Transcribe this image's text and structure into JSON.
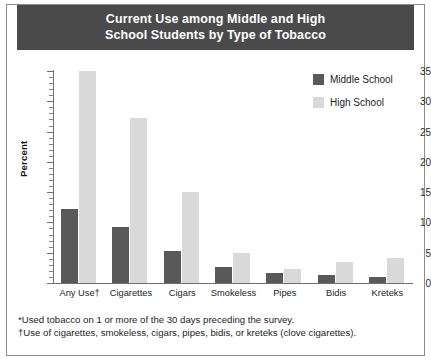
{
  "figure": {
    "title": "Current Use among Middle and High\nSchool Students by Type of Tobacco",
    "footnotes": [
      "*Used tobacco on 1 or more of the 30 days preceding the survey.",
      "†Use of cigarettes, smokeless, cigars, pipes, bidis, or kreteks (clove cigarettes)."
    ]
  },
  "colors": {
    "banner": "#4a4a4a",
    "middle_school": "#595959",
    "high_school": "#d9d9d9",
    "axis": "#6f6f6f",
    "frame": "#8d8d8d",
    "background": "#ffffff"
  },
  "legend": {
    "position": "top-right",
    "entries": [
      {
        "label": "Middle School",
        "color": "#595959",
        "swatch": "middle-school-swatch"
      },
      {
        "label": "High School",
        "color": "#d9d9d9",
        "swatch": "high-school-swatch"
      }
    ]
  },
  "chart_data": {
    "type": "bar",
    "title": "Current Use among Middle and High School Students by Type of Tobacco",
    "xlabel": "",
    "ylabel": "Percent",
    "ylim": [
      0,
      35
    ],
    "ytick_labels": [
      "0",
      "5",
      "10",
      "15",
      "20",
      "25",
      "30",
      "35"
    ],
    "ytick_values": [
      0,
      5,
      10,
      15,
      20,
      25,
      30,
      35
    ],
    "ytick_minor_step": 1,
    "grid": false,
    "legend_position": "upper right",
    "categories": [
      "Any Use†",
      "Cigarettes",
      "Cigars",
      "Smokeless",
      "Pipes",
      "Bidis",
      "Kreteks"
    ],
    "series": [
      {
        "name": "Middle School",
        "color": "#595959",
        "values": [
          12.2,
          9.2,
          5.3,
          2.7,
          1.6,
          1.4,
          1.0
        ]
      },
      {
        "name": "High School",
        "color": "#d9d9d9",
        "values": [
          35.0,
          27.3,
          15.0,
          4.9,
          2.3,
          3.5,
          4.1
        ]
      }
    ],
    "annotations": [
      "*Used tobacco on 1 or more of the 30 days preceding the survey.",
      "†Use of cigarettes, smokeless, cigars, pipes, bidis, or kreteks (clove cigarettes)."
    ]
  }
}
